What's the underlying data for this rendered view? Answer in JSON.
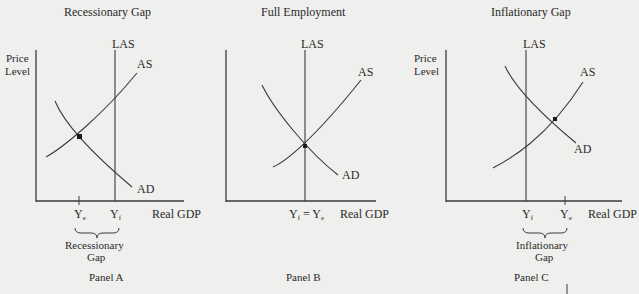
{
  "panels": [
    {
      "id": "A",
      "title": "Recessionary Gap",
      "y_axis_label": [
        "Price",
        "Level"
      ],
      "x_axis_label": "Real GDP",
      "curves": {
        "las": "LAS",
        "as": "AS",
        "ad": "AD"
      },
      "ticks": {
        "ye": "Y",
        "ye_sub": "e",
        "yf": "Y",
        "yf_sub": "f"
      },
      "gap_label": [
        "Recessionary",
        "Gap"
      ],
      "caption": "Panel A"
    },
    {
      "id": "B",
      "title": "Full Employment",
      "x_axis_label": "Real GDP",
      "curves": {
        "las": "LAS",
        "as": "AS",
        "ad": "AD"
      },
      "ticks": {
        "yf": "Y",
        "yf_sub": "f",
        "eq": " = ",
        "ye": "Y",
        "ye_sub": "e"
      },
      "caption": "Panel B"
    },
    {
      "id": "C",
      "title": "Inflationary Gap",
      "y_axis_label": [
        "Price",
        "Level"
      ],
      "x_axis_label": "Real GDP",
      "curves": {
        "las": "LAS",
        "as": "AS",
        "ad": "AD"
      },
      "ticks": {
        "yf": "Y",
        "yf_sub": "f",
        "ye": "Y",
        "ye_sub": "e"
      },
      "gap_label": [
        "Inflationary",
        "Gap"
      ],
      "caption": "Panel C"
    }
  ],
  "colors": {
    "line": "#3a3a3a",
    "background": "#efefed"
  }
}
